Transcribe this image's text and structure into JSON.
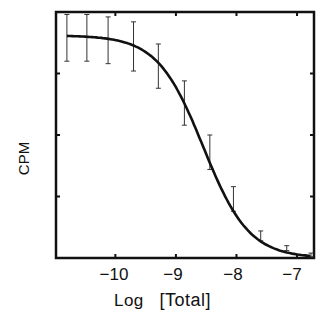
{
  "chart_data": {
    "type": "line",
    "title": "",
    "xlabel": "Log [Total]",
    "ylabel": "CPM",
    "xlim": [
      -10.98,
      -6.72
    ],
    "ylim": [
      0,
      100
    ],
    "xticks": [
      -10,
      -9,
      -8,
      -7
    ],
    "xtick_labels": [
      "−10",
      "−9",
      "−8",
      "−7"
    ],
    "yticks_unlabeled": true,
    "grid": false,
    "legend": null,
    "series": [
      {
        "name": "data",
        "style": "error bars",
        "x": [
          -10.8,
          -10.47,
          -10.12,
          -9.7,
          -9.29,
          -8.86,
          -8.44,
          -8.05,
          -7.6,
          -7.17,
          -6.77
        ],
        "y": [
          90,
          90,
          89,
          86,
          76,
          62,
          42,
          23,
          9,
          4,
          1
        ],
        "y_err_low": [
          80,
          80,
          79,
          76,
          69,
          54,
          36,
          19,
          7,
          3,
          0.5
        ],
        "y_err_high": [
          99,
          99,
          98,
          96,
          87,
          72,
          50,
          29,
          11,
          5,
          2
        ]
      },
      {
        "name": "fitted curve",
        "style": "solid line",
        "x": [
          -10.8,
          -10.4,
          -10.0,
          -9.6,
          -9.2,
          -8.8,
          -8.4,
          -8.0,
          -7.6,
          -7.2,
          -6.77
        ],
        "y": [
          90,
          89.5,
          88,
          84,
          75,
          60,
          41,
          24,
          11,
          4.5,
          1
        ]
      }
    ]
  },
  "labels": {
    "xlabel_log": "Log",
    "xlabel_bracket": "[Total]",
    "ylabel": "CPM",
    "ticks": [
      "−10",
      "−9",
      "−8",
      "−7"
    ]
  }
}
